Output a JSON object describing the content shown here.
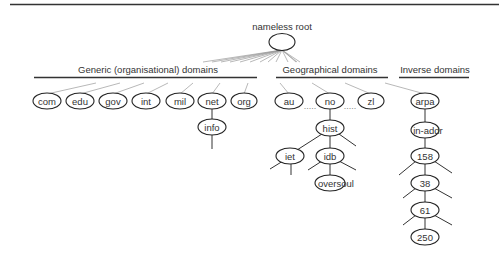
{
  "diagram": {
    "root": {
      "label": "nameless root"
    },
    "sections": [
      {
        "id": "generic",
        "label": "Generic (organisational) domains"
      },
      {
        "id": "geographical",
        "label": "Geographical  domains"
      },
      {
        "id": "inverse",
        "label": "Inverse domains"
      }
    ],
    "nodes": {
      "com": "com",
      "edu": "edu",
      "gov": "gov",
      "int": "int",
      "mil": "mil",
      "net": "net",
      "org": "org",
      "info": "info",
      "au": "au",
      "no": "no",
      "zl": "zl",
      "hist": "hist",
      "iet": "iet",
      "idb": "idb",
      "oversoul": "oversoul",
      "arpa": "arpa",
      "in_addr": "in-addr",
      "n158": "158",
      "n38": "38",
      "n61": "61",
      "n250": "250"
    },
    "ellipsis": "....."
  }
}
